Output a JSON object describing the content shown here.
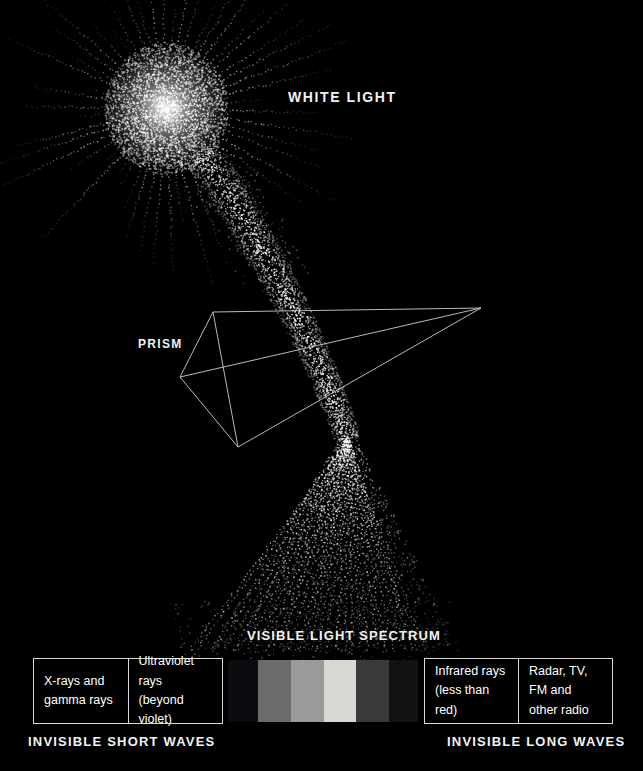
{
  "diagram": {
    "title": "Visible Light Spectrum",
    "background_color": "#000000",
    "line_color": "#d8d8d8",
    "text_color": "#ffffff"
  },
  "labels": {
    "white_light": "WHITE LIGHT",
    "prism": "PRISM",
    "visible_light_spectrum": "VISIBLE LIGHT SPECTRUM",
    "invisible_short_waves": "INVISIBLE SHORT WAVES",
    "invisible_long_waves": "INVISIBLE LONG WAVES"
  },
  "short_wave_boxes": [
    {
      "text": "X-rays and\ngamma rays"
    },
    {
      "text": "Ultraviolet rays\n(beyond violet)"
    }
  ],
  "long_wave_boxes": [
    {
      "text": "Infrared rays\n(less than red)"
    },
    {
      "text": "Radar, TV,\nFM and\nother radio"
    }
  ],
  "chart_data": {
    "type": "bar",
    "title": "VISIBLE LIGHT SPECTRUM",
    "xlabel": "",
    "ylabel": "",
    "grid": false,
    "legend": "none",
    "categories": [
      "violet",
      "blue",
      "green",
      "yellow",
      "orange",
      "red"
    ],
    "values": [
      1,
      1,
      1,
      1,
      1,
      1
    ],
    "colors": [
      "#0c0c10",
      "#6b6b6b",
      "#9a9a9a",
      "#d9d9d4",
      "#3a3a3a",
      "#121212"
    ],
    "band_widths_px": [
      28,
      31,
      31,
      31,
      31,
      27
    ],
    "annotations": [
      "INVISIBLE SHORT WAVES",
      "INVISIBLE LONG WAVES"
    ]
  }
}
